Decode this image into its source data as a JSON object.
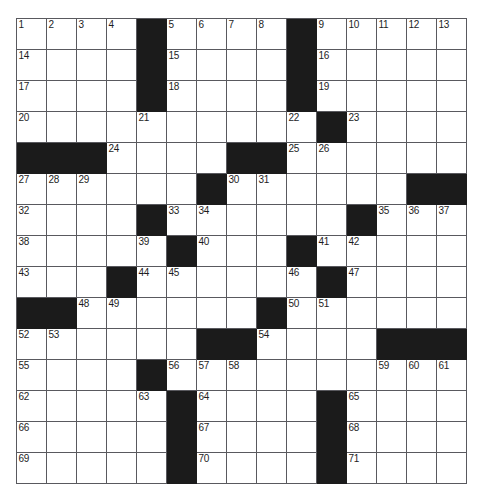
{
  "puzzle": {
    "title": "Crossword Puzzle Grid",
    "rows": 15,
    "cols": 15,
    "colors": {
      "block": "#1b1b1b",
      "open": "#ffffff",
      "grid_line": "#59595e",
      "number_text": "#1d1d1d",
      "page_background": "#ffffff"
    },
    "layout_note": "1 = open (white) square, 0 = blocked (black) square",
    "grid": [
      [
        1,
        1,
        1,
        1,
        0,
        1,
        1,
        1,
        1,
        0,
        1,
        1,
        1,
        1,
        1
      ],
      [
        1,
        1,
        1,
        1,
        0,
        1,
        1,
        1,
        1,
        0,
        1,
        1,
        1,
        1,
        1
      ],
      [
        1,
        1,
        1,
        1,
        0,
        1,
        1,
        1,
        1,
        0,
        1,
        1,
        1,
        1,
        1
      ],
      [
        1,
        1,
        1,
        1,
        1,
        1,
        1,
        1,
        1,
        1,
        0,
        1,
        1,
        1,
        1
      ],
      [
        0,
        0,
        0,
        1,
        1,
        1,
        1,
        0,
        0,
        1,
        1,
        1,
        1,
        1,
        1
      ],
      [
        1,
        1,
        1,
        1,
        1,
        1,
        0,
        1,
        1,
        1,
        1,
        1,
        1,
        0,
        0
      ],
      [
        1,
        1,
        1,
        1,
        0,
        1,
        1,
        1,
        1,
        1,
        1,
        0,
        1,
        1,
        1
      ],
      [
        1,
        1,
        1,
        1,
        1,
        0,
        1,
        1,
        1,
        0,
        1,
        1,
        1,
        1,
        1
      ],
      [
        1,
        1,
        1,
        0,
        1,
        1,
        1,
        1,
        1,
        1,
        0,
        1,
        1,
        1,
        1
      ],
      [
        0,
        0,
        1,
        1,
        1,
        1,
        1,
        1,
        0,
        1,
        1,
        1,
        1,
        1,
        1
      ],
      [
        1,
        1,
        1,
        1,
        1,
        1,
        0,
        0,
        1,
        1,
        1,
        1,
        0,
        0,
        0
      ],
      [
        1,
        1,
        1,
        1,
        0,
        1,
        1,
        1,
        1,
        1,
        1,
        1,
        1,
        1,
        1
      ],
      [
        1,
        1,
        1,
        1,
        1,
        0,
        1,
        1,
        1,
        1,
        0,
        1,
        1,
        1,
        1
      ],
      [
        1,
        1,
        1,
        1,
        1,
        0,
        1,
        1,
        1,
        1,
        0,
        1,
        1,
        1,
        1
      ],
      [
        1,
        1,
        1,
        1,
        1,
        0,
        1,
        1,
        1,
        1,
        0,
        1,
        1,
        1,
        1
      ]
    ],
    "numbers": [
      [
        1,
        2,
        3,
        4,
        null,
        5,
        6,
        7,
        8,
        null,
        9,
        10,
        11,
        12,
        13
      ],
      [
        14,
        null,
        null,
        null,
        null,
        15,
        null,
        null,
        null,
        null,
        16,
        null,
        null,
        null,
        null
      ],
      [
        17,
        null,
        null,
        null,
        null,
        18,
        null,
        null,
        null,
        null,
        19,
        null,
        null,
        null,
        null
      ],
      [
        20,
        null,
        null,
        null,
        21,
        null,
        null,
        null,
        null,
        22,
        null,
        23,
        null,
        null,
        null
      ],
      [
        null,
        null,
        null,
        24,
        null,
        null,
        null,
        null,
        null,
        25,
        26,
        null,
        null,
        null,
        null
      ],
      [
        27,
        28,
        29,
        null,
        null,
        null,
        null,
        30,
        31,
        null,
        null,
        null,
        null,
        null,
        null
      ],
      [
        32,
        null,
        null,
        null,
        null,
        33,
        34,
        null,
        null,
        null,
        null,
        null,
        35,
        36,
        37
      ],
      [
        38,
        null,
        null,
        null,
        39,
        null,
        40,
        null,
        null,
        null,
        41,
        42,
        null,
        null,
        null
      ],
      [
        43,
        null,
        null,
        null,
        44,
        45,
        null,
        null,
        null,
        46,
        null,
        47,
        null,
        null,
        null
      ],
      [
        null,
        null,
        48,
        49,
        null,
        null,
        null,
        null,
        null,
        50,
        51,
        null,
        null,
        null,
        null
      ],
      [
        52,
        53,
        null,
        null,
        null,
        null,
        null,
        null,
        54,
        null,
        null,
        null,
        null,
        null,
        null
      ],
      [
        55,
        null,
        null,
        null,
        null,
        56,
        57,
        58,
        null,
        null,
        null,
        null,
        59,
        60,
        61
      ],
      [
        62,
        null,
        null,
        null,
        63,
        null,
        64,
        null,
        null,
        null,
        null,
        65,
        null,
        null,
        null
      ],
      [
        66,
        null,
        null,
        null,
        null,
        null,
        67,
        null,
        null,
        null,
        null,
        68,
        null,
        null,
        null
      ],
      [
        69,
        null,
        null,
        null,
        null,
        null,
        70,
        null,
        null,
        null,
        null,
        71,
        null,
        null,
        null
      ]
    ],
    "letters": [
      [
        "",
        "",
        "",
        "",
        "",
        "",
        "",
        "",
        "",
        "",
        "",
        "",
        "",
        "",
        ""
      ],
      [
        "",
        "",
        "",
        "",
        "",
        "",
        "",
        "",
        "",
        "",
        "",
        "",
        "",
        "",
        ""
      ],
      [
        "",
        "",
        "",
        "",
        "",
        "",
        "",
        "",
        "",
        "",
        "",
        "",
        "",
        "",
        ""
      ],
      [
        "",
        "",
        "",
        "",
        "",
        "",
        "",
        "",
        "",
        "",
        "",
        "",
        "",
        "",
        ""
      ],
      [
        "",
        "",
        "",
        "",
        "",
        "",
        "",
        "",
        "",
        "",
        "",
        "",
        "",
        "",
        ""
      ],
      [
        "",
        "",
        "",
        "",
        "",
        "",
        "",
        "",
        "",
        "",
        "",
        "",
        "",
        "",
        ""
      ],
      [
        "",
        "",
        "",
        "",
        "",
        "",
        "",
        "",
        "",
        "",
        "",
        "",
        "",
        "",
        ""
      ],
      [
        "",
        "",
        "",
        "",
        "",
        "",
        "",
        "",
        "",
        "",
        "",
        "",
        "",
        "",
        ""
      ],
      [
        "",
        "",
        "",
        "",
        "",
        "",
        "",
        "",
        "",
        "",
        "",
        "",
        "",
        "",
        ""
      ],
      [
        "",
        "",
        "",
        "",
        "",
        "",
        "",
        "",
        "",
        "",
        "",
        "",
        "",
        "",
        ""
      ],
      [
        "",
        "",
        "",
        "",
        "",
        "",
        "",
        "",
        "",
        "",
        "",
        "",
        "",
        "",
        ""
      ],
      [
        "",
        "",
        "",
        "",
        "",
        "",
        "",
        "",
        "",
        "",
        "",
        "",
        "",
        "",
        ""
      ],
      [
        "",
        "",
        "",
        "",
        "",
        "",
        "",
        "",
        "",
        "",
        "",
        "",
        "",
        "",
        ""
      ],
      [
        "",
        "",
        "",
        "",
        "",
        "",
        "",
        "",
        "",
        "",
        "",
        "",
        "",
        "",
        ""
      ],
      [
        "",
        "",
        "",
        "",
        "",
        "",
        "",
        "",
        "",
        "",
        "",
        "",
        "",
        "",
        ""
      ]
    ]
  }
}
